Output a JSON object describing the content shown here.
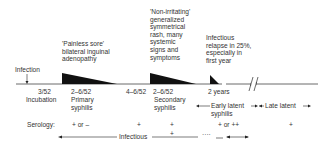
{
  "annotations": {
    "infection": "Infection",
    "primary_desc": [
      "'Painless sore'",
      "bilateral inguinal",
      "adenopathy"
    ],
    "secondary_desc": [
      "'Non-irritating'",
      "generalized",
      "symmetrical",
      "rash, many",
      "systemic",
      "signs and",
      "symptoms"
    ],
    "relapse_desc": [
      "Infectious",
      "relapse in 25%,",
      "especially in",
      "first year"
    ]
  },
  "timeline": {
    "incubation_time": "3/52",
    "incubation_label": "Incubation",
    "primary_time": "2–6/52",
    "primary_label": [
      "Primary",
      "syphilis"
    ],
    "gap_time": "4–6/52",
    "secondary_time": "2–6/52",
    "secondary_label": [
      "Secondary",
      "syphilis"
    ],
    "early_latent_time": "2 years",
    "early_latent_label": [
      "Early latent",
      "syphilis"
    ],
    "late_latent_label": "Late latent"
  },
  "serology": {
    "label": "Serology:",
    "incubation": "+ or –",
    "primary": "+",
    "secondary_top": "+",
    "secondary_bottom": "+",
    "early_latent": "+ or ++",
    "late_latent": "+"
  },
  "infectious": {
    "label": "Infectious",
    "dots": "····"
  },
  "colors": {
    "line": "#333333",
    "fill": "#111111",
    "text": "#333333"
  }
}
